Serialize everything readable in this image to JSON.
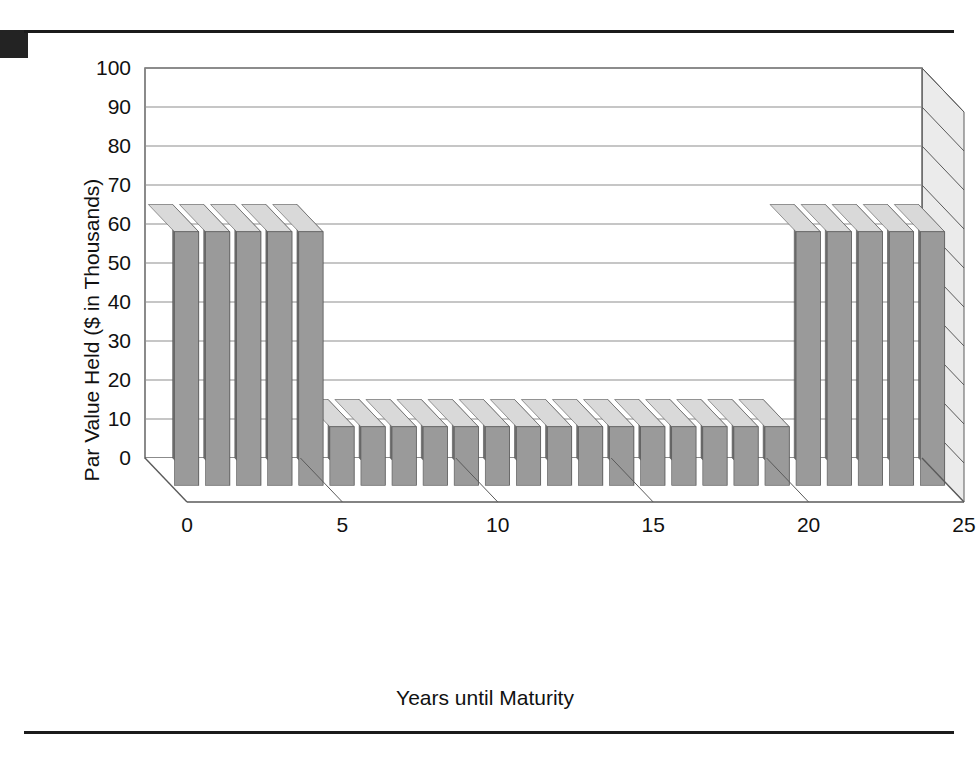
{
  "page": {
    "figure_caption": ""
  },
  "chart_data": {
    "type": "bar",
    "title": "",
    "subtitle": "",
    "xlabel": "Years until Maturity",
    "ylabel": "Par Value Held ($ in Thousands)",
    "xlim": [
      0,
      25
    ],
    "ylim": [
      0,
      100
    ],
    "ytick_labels": [
      "0",
      "10",
      "20",
      "30",
      "40",
      "50",
      "60",
      "70",
      "80",
      "90",
      "100"
    ],
    "ytick_values": [
      0,
      10,
      20,
      30,
      40,
      50,
      60,
      70,
      80,
      90,
      100
    ],
    "xtick_labels": [
      "0",
      "5",
      "10",
      "15",
      "20",
      "25"
    ],
    "xtick_values": [
      0,
      5,
      10,
      15,
      20,
      25
    ],
    "grid": true,
    "grid_axis": "y",
    "legend": false,
    "legend_position": "none",
    "style": "3d-bar",
    "annotations": [],
    "categories": [
      1,
      2,
      3,
      4,
      5,
      6,
      7,
      8,
      9,
      10,
      11,
      12,
      13,
      14,
      15,
      16,
      17,
      18,
      19,
      20,
      21,
      22,
      23,
      24,
      25
    ],
    "values": [
      65,
      65,
      65,
      65,
      65,
      15,
      15,
      15,
      15,
      15,
      15,
      15,
      15,
      15,
      15,
      15,
      15,
      15,
      15,
      15,
      65,
      65,
      65,
      65,
      65
    ],
    "series": [
      {
        "name": "Par Value Held",
        "values": [
          65,
          65,
          65,
          65,
          65,
          15,
          15,
          15,
          15,
          15,
          15,
          15,
          15,
          15,
          15,
          15,
          15,
          15,
          15,
          15,
          65,
          65,
          65,
          65,
          65
        ]
      }
    ]
  },
  "colors": {
    "bar_front": "#9a9a9a",
    "bar_side": "#6f6f6f",
    "bar_top": "#d9d9d9",
    "wall": "#ffffff",
    "wall_side": "#ebebeb",
    "floor": "#ffffff",
    "axis": "#5a5a5a",
    "grid": "#8d8d8d",
    "text": "#111111",
    "rule": "#1b1b1b"
  }
}
